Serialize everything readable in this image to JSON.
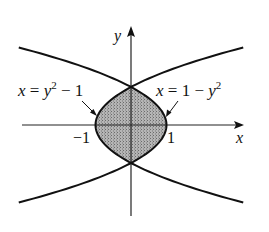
{
  "figure": {
    "type": "region-between-curves",
    "axes": {
      "x_label": "x",
      "y_label": "y",
      "origin_px": [
        131,
        125
      ],
      "unit_px": [
        35.5,
        38
      ],
      "x_axis_px": [
        22,
        243
      ],
      "y_axis_px": [
        216,
        26
      ]
    },
    "curves": [
      {
        "name": "left-parabola",
        "equation": "x = y^2 - 1",
        "label_parts": {
          "lhs": "x",
          "eq": " = ",
          "base": "y",
          "sup": "2",
          "rest": " − 1"
        },
        "y_range": [
          -2.04,
          2.04
        ]
      },
      {
        "name": "right-parabola",
        "equation": "x = 1 - y^2",
        "label_parts": {
          "lhs": "x",
          "eq": " = 1 − ",
          "base": "y",
          "sup": "2"
        },
        "y_range": [
          -2.04,
          2.04
        ]
      }
    ],
    "shaded_region": {
      "description": "region enclosed between x = y^2 - 1 and x = 1 - y^2",
      "y_range": [
        -1,
        1
      ],
      "fill": "#9a9a9a"
    },
    "tick_labels": {
      "neg_one": "−1",
      "one": "1"
    },
    "colors": {
      "stroke": "#111111",
      "shade": "#a8a8a8"
    }
  }
}
